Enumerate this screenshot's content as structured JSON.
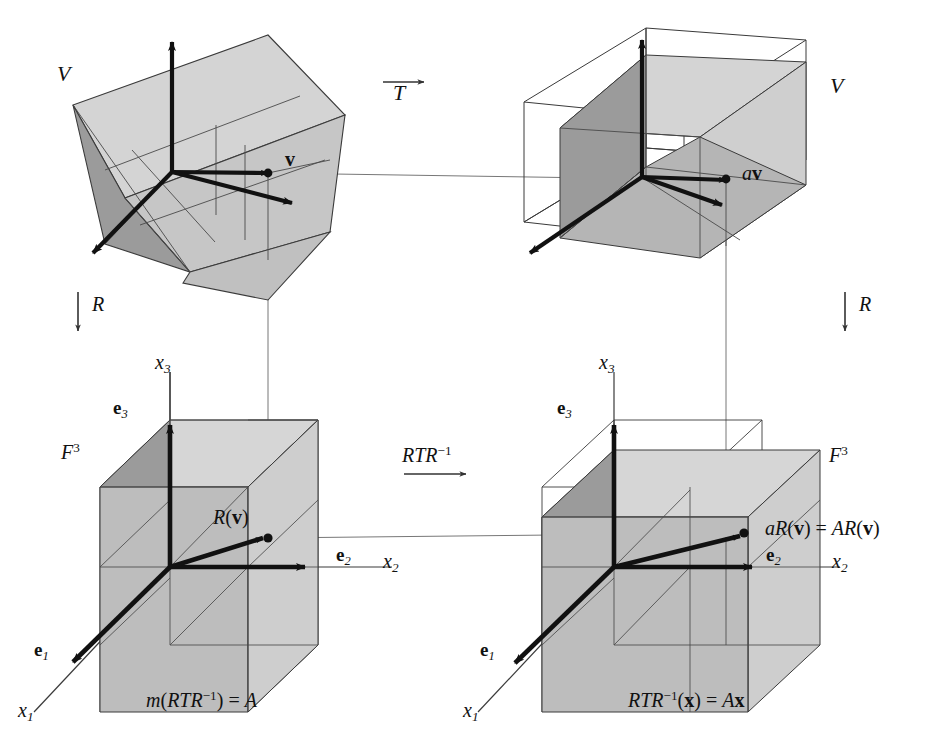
{
  "figure": {
    "kind": "commutative-diagram",
    "background_color": "#ffffff",
    "ink_color": "#111111",
    "face_colors": {
      "dark": "#9b9b9b",
      "mid": "#b8b8b8",
      "light": "#cfcfcf",
      "pale": "#dadada",
      "outline": "#3a3a3a",
      "thin_line": "#777777"
    }
  },
  "panels": {
    "top_left": {
      "space_label": "V",
      "point_label": "v",
      "name": "domain-space-V"
    },
    "top_right": {
      "space_label": "V",
      "point_label_scalar": "a",
      "point_label_vector": "v",
      "name": "codomain-space-V"
    },
    "bottom_left": {
      "space_label_base": "F",
      "space_label_exp": "3",
      "point_label": "R(v)",
      "point_label_fn": "R",
      "point_label_arg": "v",
      "axis_x1": "x",
      "axis_x1_sub": "1",
      "axis_x2": "x",
      "axis_x2_sub": "2",
      "axis_x3": "x",
      "axis_x3_sub": "3",
      "basis_e1": "e",
      "basis_e1_sub": "1",
      "basis_e2": "e",
      "basis_e2_sub": "2",
      "basis_e3": "e",
      "basis_e3_sub": "3",
      "caption_fn": "m",
      "caption_inner": "RTR",
      "caption_exp": "−1",
      "caption_eq": ") =",
      "caption_result": "A",
      "name": "coordinate-space-F3-left"
    },
    "bottom_right": {
      "space_label_base": "F",
      "space_label_exp": "3",
      "point_label_scalar": "a",
      "point_label_fn": "R",
      "point_label_arg": "v",
      "point_label_eq": "=",
      "point_label_matrix": "AR",
      "axis_x1": "x",
      "axis_x1_sub": "1",
      "axis_x2": "x",
      "axis_x2_sub": "2",
      "axis_x3": "x",
      "axis_x3_sub": "3",
      "basis_e1": "e",
      "basis_e1_sub": "1",
      "basis_e2": "e",
      "basis_e2_sub": "2",
      "basis_e3": "e",
      "basis_e3_sub": "3",
      "caption_lhs": "RTR",
      "caption_exp": "−1",
      "caption_arg": "(x) =",
      "caption_rhs_matrix": "A",
      "caption_rhs_vec": "x",
      "name": "coordinate-space-F3-right"
    }
  },
  "arrows": {
    "top": {
      "label": "T",
      "direction": "right",
      "decoration": "overbar-arrow",
      "name": "transformation-arrow-T"
    },
    "left": {
      "label": "R",
      "direction": "down",
      "name": "coordinate-map-arrow-R-left"
    },
    "right": {
      "label": "R",
      "direction": "down",
      "name": "coordinate-map-arrow-R-right"
    },
    "bottom": {
      "label_base": "RTR",
      "label_exp": "−1",
      "direction": "right",
      "decoration": "underbar-arrow",
      "name": "matrix-transformation-arrow"
    }
  }
}
